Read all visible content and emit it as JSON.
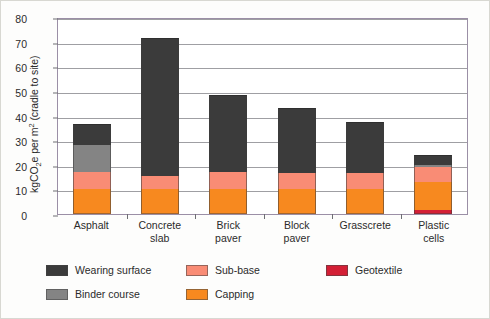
{
  "figure": {
    "y_axis_title_html": "kgCO<sub>2</sub>e per m<sup>2</sup> (cradle to site)",
    "y_axis_title_plain": "kgCO2e per m2 (cradle to site)"
  },
  "chart_data": {
    "type": "bar",
    "subtype": "stacked-vertical",
    "title": "",
    "xlabel": "",
    "ylabel": "kgCO2e per m2 (cradle to site)",
    "ylim": [
      0,
      80
    ],
    "ytick_step": 10,
    "yticks": [
      0,
      10,
      20,
      30,
      40,
      50,
      60,
      70,
      80
    ],
    "ytick_labels": [
      "0",
      "10",
      "20",
      "30",
      "40",
      "50",
      "60",
      "70",
      "80"
    ],
    "grid": true,
    "grid_axis": "y",
    "legend_position": "below-plot",
    "categories": [
      "Asphalt",
      "Concrete slab",
      "Brick paver",
      "Block paver",
      "Grasscrete",
      "Plastic cells"
    ],
    "category_label_lines": [
      [
        "Asphalt"
      ],
      [
        "Concrete",
        "slab"
      ],
      [
        "Brick",
        "paver"
      ],
      [
        "Block",
        "paver"
      ],
      [
        "Grasscrete"
      ],
      [
        "Plastic",
        "cells"
      ]
    ],
    "stack_order_bottom_to_top": [
      "Geotextile",
      "Capping",
      "Sub-base",
      "Binder course",
      "Wearing surface"
    ],
    "series": [
      {
        "name": "Geotextile",
        "color": "#d31f35",
        "values": [
          0,
          0,
          0,
          0,
          0,
          1.5
        ]
      },
      {
        "name": "Capping",
        "color": "#f7891f",
        "values": [
          10,
          10,
          10,
          10,
          10,
          11.5
        ]
      },
      {
        "name": "Sub-base",
        "color": "#f98c75",
        "values": [
          7,
          5.5,
          7,
          6.5,
          6.5,
          6
        ]
      },
      {
        "name": "Binder course",
        "color": "#848484",
        "values": [
          11,
          0,
          0,
          0,
          0,
          1
        ]
      },
      {
        "name": "Wearing surface",
        "color": "#3b3b3b",
        "values": [
          8.5,
          56,
          31.5,
          26.5,
          21,
          4
        ]
      }
    ],
    "totals": [
      36.5,
      71.5,
      48.5,
      43,
      37.5,
      24
    ]
  },
  "legend": {
    "entries": [
      {
        "label": "Wearing surface",
        "color": "#3b3b3b"
      },
      {
        "label": "Sub-base",
        "color": "#f98c75"
      },
      {
        "label": "Geotextile",
        "color": "#d31f35"
      },
      {
        "label": "Binder course",
        "color": "#848484"
      },
      {
        "label": "Capping",
        "color": "#f7891f"
      }
    ]
  }
}
